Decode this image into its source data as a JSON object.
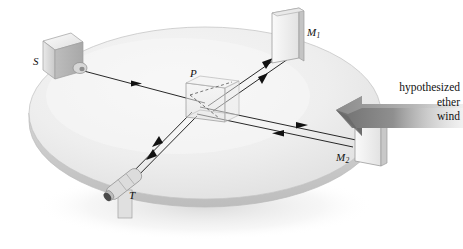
{
  "figure": {
    "background_color": "#ffffff",
    "table_color": "#efefef",
    "ink_color": "#111111",
    "arrow_color": "#8c8c8c"
  },
  "labels": {
    "source": "S",
    "beamsplitter": "P",
    "mirror_1": {
      "base": "M",
      "sub": "1"
    },
    "mirror_2": {
      "base": "M",
      "sub": "2"
    },
    "telescope": "T",
    "ether_wind_line_1": "hypothesized",
    "ether_wind_line_2": "ether",
    "ether_wind_line_3": "wind"
  },
  "components": [
    {
      "name": "light-source",
      "label": "S",
      "shape": "box-with-nozzle",
      "x": 58,
      "y": 58
    },
    {
      "name": "beam-splitter",
      "label": "P",
      "shape": "transparent-slab",
      "x": 205,
      "y": 100
    },
    {
      "name": "mirror-1",
      "label": "M1",
      "shape": "vertical-plate",
      "x": 285,
      "y": 40
    },
    {
      "name": "mirror-2",
      "label": "M2",
      "shape": "vertical-plate",
      "x": 350,
      "y": 135
    },
    {
      "name": "telescope",
      "label": "T",
      "shape": "cylinder-on-post",
      "x": 122,
      "y": 196
    },
    {
      "name": "ether-wind-arrow",
      "label": "hypothesized ether wind",
      "shape": "block-arrow",
      "direction": "left"
    }
  ],
  "beams": [
    {
      "name": "source-to-splitter",
      "from": "S",
      "to": "P",
      "arrows": 1,
      "lines": 1
    },
    {
      "name": "splitter-to-mirror-1",
      "from": "P",
      "to": "M1",
      "arrows": 2,
      "lines": 2
    },
    {
      "name": "splitter-to-mirror-2",
      "from": "P",
      "to": "M2",
      "arrows": 2,
      "lines": 2
    },
    {
      "name": "splitter-to-telescope",
      "from": "P",
      "to": "T",
      "arrows": 2,
      "lines": 2
    }
  ]
}
